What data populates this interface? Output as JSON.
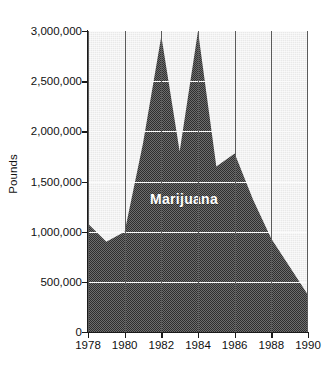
{
  "chart_data": {
    "type": "area",
    "title": "",
    "subtitle": "",
    "xlabel": "",
    "ylabel": "Pounds",
    "xlim": [
      1978,
      1990
    ],
    "ylim": [
      0,
      3000000
    ],
    "grid": "horizontal gridlines (faint white) plus dark vertical gridlines at even years",
    "legend_position": "inline label on series",
    "series_label": "Marijuana",
    "fill_pattern": "50% dithered gray halftone",
    "x": [
      1978,
      1979,
      1980,
      1981,
      1982,
      1983,
      1984,
      1985,
      1986,
      1987,
      1988,
      1989,
      1990
    ],
    "categories": [
      "1978",
      "1979",
      "1980",
      "1981",
      "1982",
      "1983",
      "1984",
      "1985",
      "1986",
      "1987",
      "1988",
      "1989",
      "1990"
    ],
    "series": [
      {
        "name": "Marijuana",
        "values": [
          1080000,
          900000,
          1000000,
          1880000,
          2950000,
          1800000,
          3000000,
          1650000,
          1780000,
          1320000,
          930000,
          650000,
          370000
        ]
      }
    ],
    "values": [
      1080000,
      900000,
      1000000,
      1880000,
      2950000,
      1800000,
      3000000,
      1650000,
      1780000,
      1320000,
      930000,
      650000,
      370000
    ],
    "y_ticks": [
      0,
      500000,
      1000000,
      1500000,
      2000000,
      2500000,
      3000000
    ],
    "y_tick_labels": [
      "0",
      "500,000",
      "1,000,000",
      "1,500,000",
      "2,000,000",
      "2,500,000",
      "3,000,000"
    ],
    "x_ticks": [
      1978,
      1980,
      1982,
      1984,
      1986,
      1988,
      1990
    ],
    "x_tick_labels": [
      "1978",
      "1980",
      "1982",
      "1984",
      "1986",
      "1988",
      "1990"
    ],
    "colors": {
      "area_fill": "#3a3a3a",
      "panel_background": "#e9e9e9",
      "axis": "#1a1a1a",
      "vertical_gridline": "#5a5a5a",
      "horizontal_gridline": "#fbfbfb",
      "series_label_text": "#ffffff",
      "tick_text": "#111111",
      "page_background": "#ffffff"
    }
  }
}
